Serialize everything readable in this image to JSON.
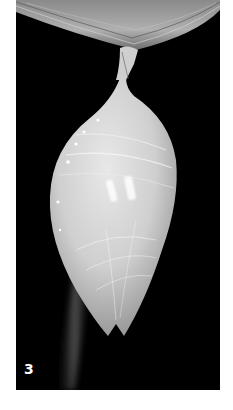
{
  "image": {
    "subject": "butterfly chrysalis hanging from a branch",
    "style": "black-and-white photograph",
    "figure_label": "3",
    "colors": {
      "background": "#000000",
      "border": "#ffffff",
      "chrysalis_light": "#e6e6e6",
      "chrysalis_mid": "#bdbdbd",
      "branch": "#9a9a9a"
    }
  }
}
